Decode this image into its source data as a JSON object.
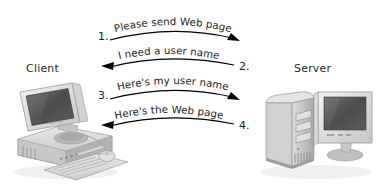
{
  "diagram": {
    "background_color": "#ffffff",
    "line_color": "#000000",
    "text_color": "#1c1c1c"
  },
  "endpoints": {
    "client": {
      "label": "Client",
      "icon": "desktop-computer-icon"
    },
    "server": {
      "label": "Server",
      "icon": "server-tower-icon"
    }
  },
  "messages": [
    {
      "number": "1.",
      "text": "Please send Web page",
      "direction": "client-to-server"
    },
    {
      "number": "2.",
      "text": "I need a user name",
      "direction": "server-to-client"
    },
    {
      "number": "3.",
      "text": "Here's my user name",
      "direction": "client-to-server"
    },
    {
      "number": "4.",
      "text": "Here's the Web page",
      "direction": "server-to-client"
    }
  ]
}
